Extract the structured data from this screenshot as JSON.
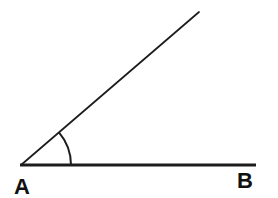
{
  "figure": {
    "background_color": "#ffffff",
    "stroke_color": "#1c1c1c",
    "label_color": "#111111",
    "angle_degrees_estimate": 40.5,
    "vertex": {
      "x": 21,
      "y": 165
    },
    "horizontal_ray": {
      "x1": 20,
      "y1": 165,
      "x2": 256,
      "y2": 165,
      "stroke_width": 3
    },
    "slanted_ray": {
      "x1": 21,
      "y1": 165,
      "x2": 199,
      "y2": 12,
      "stroke_width": 1.7
    },
    "angle_arc": {
      "radius": 50,
      "stroke_width": 2
    },
    "labels": {
      "vertex": {
        "text": "A",
        "x": 22,
        "y": 194
      },
      "endpoint": {
        "text": "B",
        "x": 245,
        "y": 188
      }
    }
  }
}
